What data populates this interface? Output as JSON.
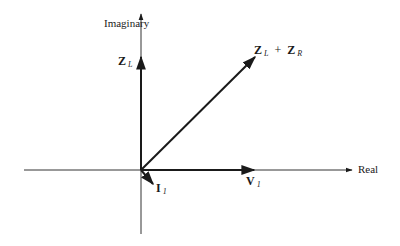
{
  "axes": {
    "vertical_label": "Imaginary",
    "horizontal_label": "Real"
  },
  "vectors": {
    "zl": {
      "base": "Z",
      "sub": "L"
    },
    "sum": {
      "base1": "Z",
      "sub1": "L",
      "op": "+",
      "base2": "Z",
      "sub2": "R"
    },
    "i1": {
      "base": "I",
      "sub": "1"
    },
    "v1": {
      "base": "V",
      "sub": "1"
    }
  },
  "colors": {
    "ink": "#1a1a1a",
    "background": "#ffffff"
  }
}
